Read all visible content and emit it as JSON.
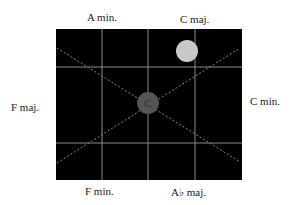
{
  "diagram": {
    "type": "tonnetz-style neighbor grid",
    "background_color": "#000000",
    "grid_color": "#8a8a8a",
    "labels": {
      "top_left": "A min.",
      "top_right": "C maj.",
      "left": "F maj.",
      "right": "C min.",
      "bottom_left": "F min.",
      "bottom_right": "A♭ maj."
    },
    "nodes": [
      {
        "id": "center",
        "label": "C",
        "color": "#555555",
        "label_color": "#2a2a2a"
      },
      {
        "id": "highlight",
        "label": "",
        "color": "#c8c8c8"
      }
    ]
  }
}
